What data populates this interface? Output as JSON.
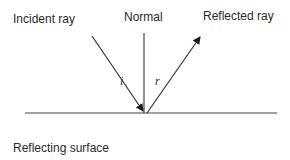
{
  "labels": {
    "incident_ray": "Incident ray",
    "normal": "Normal",
    "reflected_ray": "Reflected ray",
    "reflecting_surface": "Reflecting surface",
    "angle_incidence": "i",
    "angle_reflection": "r"
  },
  "geometry": {
    "surface": {
      "x1": 25,
      "y1": 113,
      "x2": 277,
      "y2": 113
    },
    "normal": {
      "x1": 144,
      "y1": 33,
      "x2": 144,
      "y2": 113
    },
    "incident_ray": {
      "x1": 92,
      "y1": 36,
      "x2": 144,
      "y2": 112
    },
    "reflected_ray": {
      "x1": 147,
      "y1": 113,
      "x2": 201,
      "y2": 35
    }
  },
  "colors": {
    "line": "#333333",
    "text": "#2a2a2a"
  }
}
